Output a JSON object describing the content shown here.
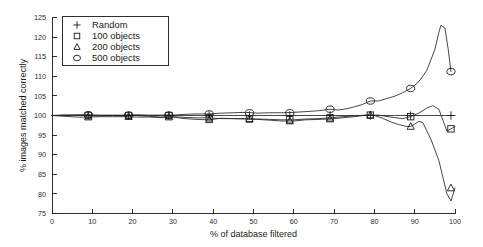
{
  "chart_data": {
    "type": "line",
    "title": "",
    "xlabel": "% of database filtered",
    "ylabel": "% images matched correctly",
    "xlim": [
      0,
      100
    ],
    "ylim": [
      75,
      125
    ],
    "xticks": [
      0,
      10,
      20,
      30,
      40,
      50,
      60,
      70,
      80,
      90,
      100
    ],
    "xticklabels": [
      "0",
      "10",
      "20",
      "30",
      "40",
      "50",
      "60",
      "70",
      "80",
      "90",
      "100"
    ],
    "yticks": [
      75,
      80,
      85,
      90,
      95,
      100,
      105,
      110,
      115,
      120,
      125
    ],
    "yticklabels": [
      "75",
      "80",
      "85",
      "90",
      "95",
      "100",
      "105",
      "110",
      "115",
      "120",
      "125"
    ],
    "grid": false,
    "legend_position": "upper left",
    "series": [
      {
        "name": "Random",
        "marker": "plus",
        "marker_x": [
          9,
          19,
          29,
          39,
          49,
          59,
          69,
          79,
          89,
          99
        ],
        "marker_y": [
          100,
          100,
          100,
          100,
          100,
          100,
          100,
          100,
          100,
          100
        ],
        "x": [
          0,
          5,
          10,
          15,
          20,
          25,
          30,
          35,
          40,
          45,
          50,
          55,
          60,
          65,
          70,
          75,
          80,
          85,
          90,
          95,
          100
        ],
        "values": [
          100,
          100,
          100,
          100,
          100,
          100,
          100,
          100,
          100,
          100,
          100,
          100,
          100,
          100,
          100,
          100,
          100,
          100,
          100,
          100,
          100
        ]
      },
      {
        "name": "100 objects",
        "marker": "square",
        "marker_x": [
          9,
          19,
          29,
          39,
          49,
          59,
          69,
          79,
          89,
          99
        ],
        "marker_y": [
          100,
          100,
          100,
          99.4,
          99.1,
          98.9,
          99.4,
          100.1,
          99.7,
          96.6
        ],
        "x": [
          0,
          3,
          6,
          9,
          12,
          15,
          18,
          21,
          24,
          27,
          30,
          33,
          36,
          39,
          42,
          45,
          48,
          51,
          54,
          57,
          60,
          63,
          66,
          69,
          72,
          75,
          78,
          81,
          84,
          87,
          89,
          91,
          93,
          94.5,
          96,
          97,
          98,
          99,
          100
        ],
        "values": [
          100,
          100.1,
          100,
          100,
          99.9,
          100,
          99.9,
          100,
          99.8,
          99.6,
          99.7,
          99.5,
          99.4,
          99.4,
          99.2,
          99.2,
          99.1,
          99.1,
          99,
          98.9,
          98.9,
          99.1,
          99.2,
          99.4,
          99.7,
          99.9,
          100.1,
          100.1,
          99.6,
          99.2,
          99.7,
          100.6,
          101.9,
          102.5,
          101.6,
          98.8,
          96.0,
          96.6,
          97.2
        ]
      },
      {
        "name": "200 objects",
        "marker": "triangle",
        "marker_x": [
          9,
          19,
          29,
          39,
          49,
          59,
          69,
          79,
          89,
          99
        ],
        "marker_y": [
          99.6,
          99.7,
          99.6,
          98.9,
          99.2,
          98.6,
          99.1,
          100.1,
          97.2,
          81.5
        ],
        "x": [
          0,
          3,
          6,
          9,
          12,
          15,
          18,
          21,
          24,
          27,
          30,
          33,
          36,
          39,
          42,
          45,
          48,
          51,
          54,
          57,
          60,
          63,
          66,
          69,
          72,
          75,
          78,
          80,
          82,
          84,
          86,
          88,
          89,
          90,
          91,
          92,
          94,
          96,
          98,
          99,
          100
        ],
        "values": [
          100,
          99.8,
          99.6,
          99.6,
          99.7,
          99.7,
          99.7,
          99.6,
          99.6,
          99.5,
          99.6,
          99.2,
          99,
          98.9,
          99.3,
          99.2,
          99.2,
          99,
          98.8,
          98.6,
          98.6,
          98.9,
          99,
          99.1,
          99.4,
          99.7,
          100.1,
          100,
          99.3,
          98.4,
          97.7,
          97.2,
          97.2,
          97.8,
          98.5,
          98.2,
          94.0,
          88.5,
          80.0,
          78.2,
          81.5
        ]
      },
      {
        "name": "500 objects",
        "marker": "circle",
        "marker_x": [
          9,
          19,
          29,
          39,
          49,
          59,
          69,
          79,
          89,
          99
        ],
        "marker_y": [
          100.2,
          100.1,
          100.1,
          100.4,
          100.7,
          100.7,
          101.6,
          103.7,
          106.9,
          111.2
        ],
        "x": [
          0,
          3,
          6,
          9,
          12,
          15,
          18,
          21,
          24,
          27,
          30,
          33,
          36,
          39,
          42,
          45,
          48,
          51,
          54,
          57,
          60,
          63,
          66,
          69,
          71,
          73,
          75,
          77,
          79,
          81,
          83,
          85,
          87,
          89,
          91,
          93,
          95,
          96,
          96.5,
          97.5,
          98.3,
          99
        ],
        "values": [
          100,
          100.1,
          100.2,
          100.2,
          100.1,
          100.1,
          100.1,
          100.2,
          100.1,
          100.1,
          100.1,
          100.3,
          100.4,
          100.4,
          100.6,
          100.7,
          100.8,
          100.6,
          100.7,
          100.7,
          100.8,
          101.0,
          101.2,
          101.6,
          101.4,
          101.7,
          102.2,
          102.8,
          103.7,
          103.7,
          104.3,
          104.9,
          105.8,
          106.9,
          108.6,
          111.5,
          116.8,
          121.2,
          123.0,
          122.3,
          117.0,
          111.2
        ]
      }
    ]
  },
  "legend": {
    "entries": [
      {
        "label": "Random",
        "marker": "plus"
      },
      {
        "label": "100 objects",
        "marker": "square"
      },
      {
        "label": "200 objects",
        "marker": "triangle"
      },
      {
        "label": "500 objects",
        "marker": "circle"
      }
    ]
  }
}
